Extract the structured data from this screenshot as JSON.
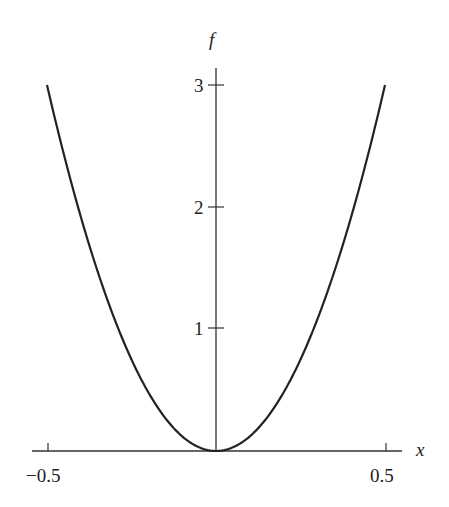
{
  "chart_data": {
    "type": "line",
    "title": "",
    "xlabel": "x",
    "ylabel": "f",
    "xlim": [
      -0.5,
      0.5
    ],
    "ylim": [
      0,
      3
    ],
    "x_ticks": [
      -0.5,
      0.5
    ],
    "x_tick_labels": [
      "−0.5",
      "0.5"
    ],
    "y_ticks": [
      1,
      2,
      3
    ],
    "y_tick_labels": [
      "1",
      "2",
      "3"
    ],
    "grid": false,
    "legend": null,
    "series": [
      {
        "name": "f(x) = 12x^2",
        "x": [
          -0.5,
          -0.4,
          -0.3,
          -0.2,
          -0.1,
          0,
          0.1,
          0.2,
          0.3,
          0.4,
          0.5
        ],
        "values": [
          3.0,
          1.92,
          1.08,
          0.48,
          0.12,
          0,
          0.12,
          0.48,
          1.08,
          1.92,
          3.0
        ]
      }
    ],
    "colors": {
      "curve": "#222222",
      "axes": "#333333"
    }
  }
}
